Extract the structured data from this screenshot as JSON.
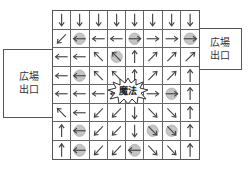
{
  "left_exit": {
    "label_line1": "広場",
    "label_line2": "出口"
  },
  "right_exit": {
    "label_line1": "広場",
    "label_line2": "出口"
  },
  "center": {
    "label": "魔法",
    "shape": "starburst"
  },
  "colors": {
    "arrow": "#444444",
    "grid": "#666666",
    "circle": "#bbbbbb"
  },
  "grid": {
    "rows": 8,
    "cols": 8,
    "cells": [
      [
        "down",
        "down",
        "down",
        "down",
        "down",
        "down",
        "down",
        "down"
      ],
      [
        "down-left",
        "left",
        "left",
        "left",
        "right",
        "right",
        "right",
        "right"
      ],
      [
        "left",
        "left",
        "up-left",
        "up-left",
        "up",
        "up-right",
        "up-right",
        "up-right"
      ],
      [
        "left",
        "left",
        "up-left",
        "up-left",
        "up",
        "up-right",
        "up-right",
        "up"
      ],
      [
        "left",
        "left",
        "left",
        "left",
        "none",
        "right",
        "right",
        "up"
      ],
      [
        "up-left",
        "left",
        "down-left",
        "down-left",
        "down",
        "down-right",
        "down-right",
        "up"
      ],
      [
        "up",
        "left",
        "down-left",
        "down-left",
        "down",
        "down-right",
        "down-right",
        "up"
      ],
      [
        "up",
        "left",
        "down-left",
        "down-left",
        "left",
        "down-right",
        "down-right",
        "up"
      ]
    ],
    "circles": [
      [
        1,
        1
      ],
      [
        1,
        4
      ],
      [
        1,
        7
      ],
      [
        2,
        3
      ],
      [
        3,
        1
      ],
      [
        4,
        6
      ],
      [
        6,
        1
      ],
      [
        6,
        5
      ],
      [
        6,
        6
      ],
      [
        7,
        1
      ],
      [
        7,
        4
      ]
    ]
  }
}
